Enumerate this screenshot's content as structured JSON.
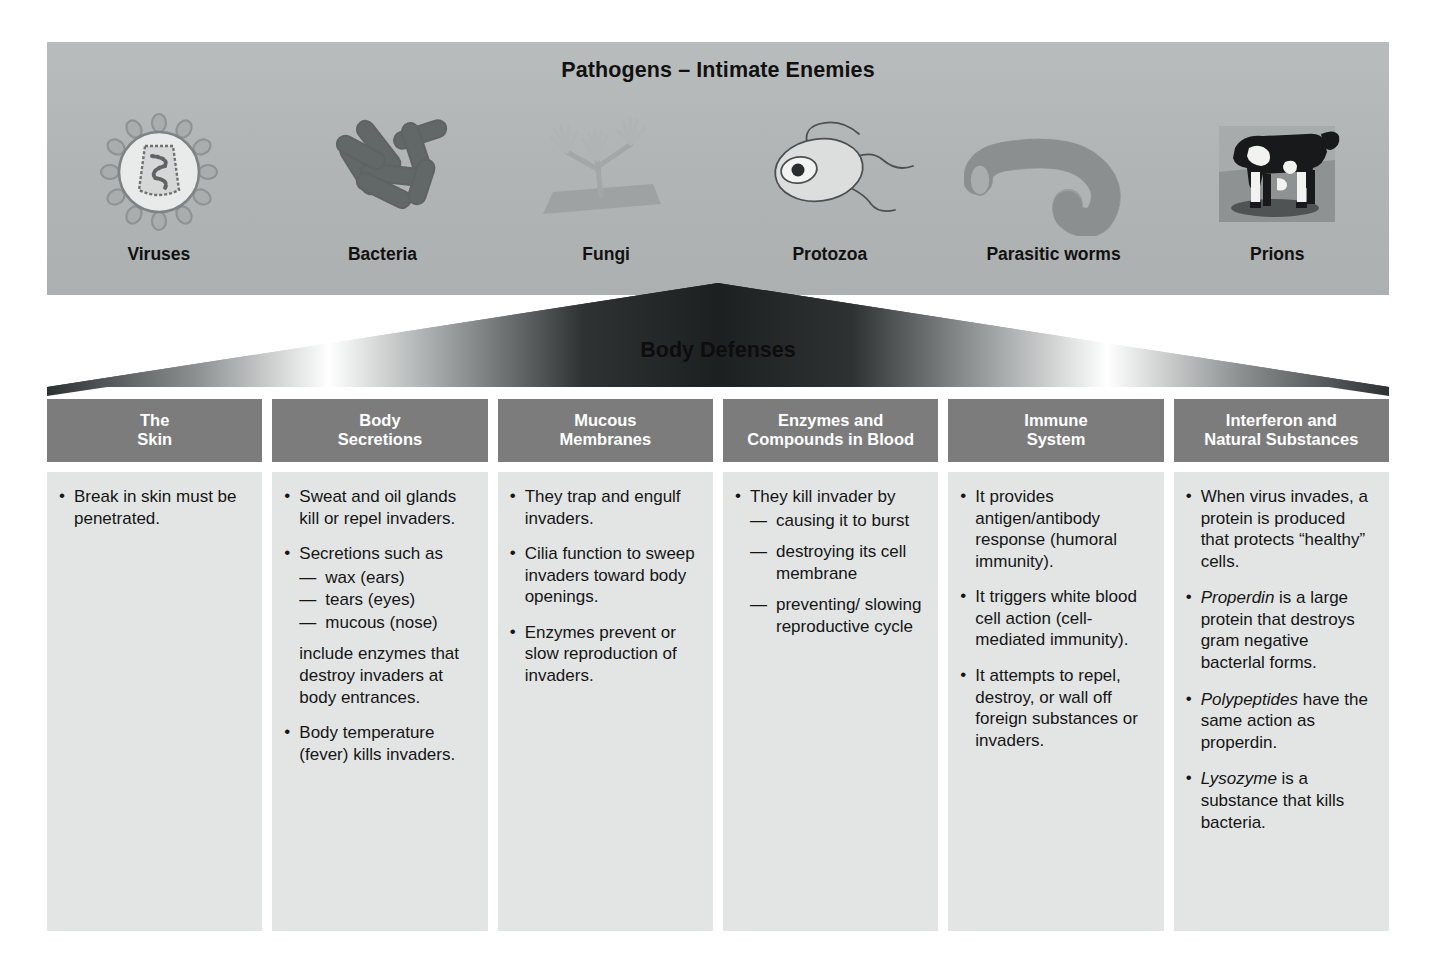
{
  "banner": {
    "title": "Pathogens – Intimate Enemies",
    "pathogens": [
      {
        "label": "Viruses",
        "icon": "virus-icon"
      },
      {
        "label": "Bacteria",
        "icon": "bacteria-rods-icon"
      },
      {
        "label": "Fungi",
        "icon": "fungus-hyphae-icon"
      },
      {
        "label": "Protozoa",
        "icon": "protozoan-flagellate-icon"
      },
      {
        "label": "Parasitic worms",
        "icon": "worm-icon"
      },
      {
        "label": "Prions",
        "icon": "cow-photo-icon"
      }
    ]
  },
  "defenses_banner": {
    "title": "Body Defenses"
  },
  "columns": [
    {
      "header_line1": "The",
      "header_line2": "Skin",
      "items": [
        {
          "text": "Break in skin must be penetrated."
        }
      ]
    },
    {
      "header_line1": "Body",
      "header_line2": "Secretions",
      "items": [
        {
          "text": "Sweat and oil glands kill or repel invaders."
        },
        {
          "text": "Secretions such as",
          "sub": [
            "wax (ears)",
            "tears (eyes)",
            "mucous (nose)"
          ]
        },
        {
          "text": "include enzymes that destroy invaders at body entrances.",
          "nobullet": true
        },
        {
          "text": "Body temperature (fever) kills invaders."
        }
      ]
    },
    {
      "header_line1": "Mucous",
      "header_line2": "Membranes",
      "items": [
        {
          "text": "They trap and engulf invaders."
        },
        {
          "text": "Cilia function to sweep invaders toward body openings."
        },
        {
          "text": "Enzymes prevent or slow reproduction of invaders."
        }
      ]
    },
    {
      "header_line1": "Enzymes and",
      "header_line2": "Compounds in Blood",
      "items": [
        {
          "text": "They kill invader by",
          "sub_spaced": [
            "causing it to burst",
            "destroying its cell membrane",
            "preventing/ slowing reproductive cycle"
          ]
        }
      ]
    },
    {
      "header_line1": "Immune",
      "header_line2": "System",
      "items": [
        {
          "text": "It provides antigen/antibody response (humoral immunity)."
        },
        {
          "text": "It triggers white blood cell action (cell-mediated immunity)."
        },
        {
          "text": "It attempts to repel, destroy, or wall off foreign substances or invaders."
        }
      ]
    },
    {
      "header_line1": "Interferon and",
      "header_line2": "Natural Substances",
      "items": [
        {
          "text": "When virus invades, a protein is produced that protects “healthy” cells."
        },
        {
          "italic_term": "Properdin",
          "text": " is a large protein that destroys gram negative bacterlal forms."
        },
        {
          "italic_term": "Polypeptides",
          "text": " have the same action as properdin."
        },
        {
          "italic_term": "Lysozyme",
          "text": " is a substance that kills bacteria."
        }
      ]
    }
  ],
  "colors": {
    "header_gray": "#7c7c7c",
    "panel_gray": "#e3e5e5",
    "banner_gray": "#b4b7b7",
    "text_dark": "#151515"
  }
}
